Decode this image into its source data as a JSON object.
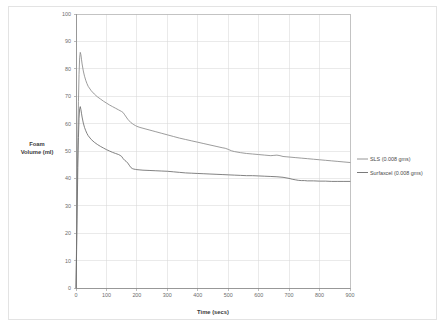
{
  "chart_data": {
    "type": "line",
    "title": "",
    "xlabel": "Time (secs)",
    "ylabel": "Foam Volume (ml)",
    "ylabel_line1": "Foam",
    "ylabel_line2": "Volume (ml)",
    "xlim": [
      0,
      900
    ],
    "ylim": [
      0,
      100
    ],
    "xticks": [
      0,
      100,
      200,
      300,
      400,
      500,
      600,
      700,
      800,
      900
    ],
    "yticks": [
      0,
      10,
      20,
      30,
      40,
      50,
      60,
      70,
      80,
      90,
      100
    ],
    "xtick_labels": [
      "0",
      "100",
      "200",
      "300",
      "400",
      "500",
      "600",
      "700",
      "800",
      "900"
    ],
    "ytick_labels": [
      "0",
      "10",
      "20",
      "30",
      "40",
      "50",
      "60",
      "70",
      "80",
      "90",
      "100"
    ],
    "grid": true,
    "grid_color": "#d6d6d6",
    "legend_position": "right",
    "series": [
      {
        "name": "SLS (0.008 gms)",
        "color": "#8a8a8a",
        "x": [
          0,
          2,
          4,
          6,
          8,
          10,
          12,
          14,
          16,
          18,
          20,
          24,
          28,
          32,
          36,
          40,
          50,
          60,
          70,
          80,
          90,
          100,
          110,
          120,
          130,
          140,
          150,
          155,
          160,
          165,
          170,
          175,
          180,
          185,
          190,
          195,
          200,
          210,
          220,
          230,
          240,
          250,
          260,
          280,
          300,
          320,
          340,
          360,
          380,
          400,
          420,
          440,
          460,
          480,
          490,
          500,
          510,
          520,
          540,
          560,
          580,
          600,
          620,
          640,
          650,
          660,
          670,
          680,
          690,
          700,
          720,
          740,
          760,
          780,
          800,
          820,
          840,
          860,
          880,
          900
        ],
        "y": [
          0,
          18,
          38,
          55,
          68,
          78,
          84,
          86,
          85.2,
          83.5,
          81.8,
          79.2,
          77.3,
          75.8,
          74.6,
          73.6,
          72.0,
          70.8,
          69.8,
          69.0,
          68.2,
          67.5,
          66.8,
          66.2,
          65.6,
          65.0,
          64.4,
          64.0,
          63.2,
          62.4,
          61.6,
          61.0,
          60.4,
          60.0,
          59.6,
          59.3,
          59.0,
          58.6,
          58.3,
          58.0,
          57.7,
          57.4,
          57.1,
          56.5,
          55.9,
          55.3,
          54.7,
          54.2,
          53.7,
          53.2,
          52.7,
          52.2,
          51.7,
          51.2,
          51.0,
          50.6,
          50.1,
          49.8,
          49.4,
          49.1,
          48.9,
          48.7,
          48.5,
          48.3,
          48.4,
          48.5,
          48.3,
          48.0,
          47.9,
          47.8,
          47.6,
          47.4,
          47.2,
          47.0,
          46.8,
          46.6,
          46.4,
          46.2,
          46.0,
          45.8
        ]
      },
      {
        "name": "Surfaxcel (0.008 gms)",
        "color": "#6b6b6b",
        "x": [
          0,
          2,
          4,
          6,
          8,
          10,
          12,
          14,
          16,
          18,
          20,
          24,
          28,
          32,
          36,
          40,
          50,
          60,
          70,
          80,
          90,
          100,
          110,
          120,
          130,
          140,
          145,
          150,
          155,
          160,
          165,
          170,
          175,
          180,
          185,
          190,
          195,
          200,
          210,
          220,
          240,
          260,
          280,
          300,
          320,
          340,
          360,
          380,
          400,
          420,
          440,
          460,
          480,
          500,
          520,
          540,
          560,
          580,
          600,
          620,
          640,
          660,
          680,
          700,
          710,
          720,
          730,
          740,
          750,
          760,
          780,
          800,
          820,
          840,
          860,
          880,
          900
        ],
        "y": [
          0,
          14,
          30,
          44,
          55,
          62,
          65.4,
          66.2,
          65.2,
          63.8,
          62.4,
          60.2,
          58.6,
          57.4,
          56.4,
          55.6,
          54.2,
          53.2,
          52.4,
          51.7,
          51.1,
          50.5,
          50.0,
          49.5,
          49.1,
          48.7,
          48.4,
          48.0,
          47.2,
          46.6,
          46.2,
          45.6,
          44.8,
          44.0,
          43.6,
          43.4,
          43.3,
          43.2,
          43.1,
          43.0,
          42.9,
          42.8,
          42.7,
          42.6,
          42.4,
          42.2,
          42.0,
          41.9,
          41.8,
          41.7,
          41.6,
          41.5,
          41.4,
          41.3,
          41.2,
          41.1,
          41.0,
          41.0,
          40.9,
          40.8,
          40.7,
          40.6,
          40.4,
          40.0,
          39.7,
          39.5,
          39.3,
          39.2,
          39.2,
          39.1,
          39.1,
          39.0,
          39.0,
          38.9,
          38.9,
          38.9,
          38.9
        ]
      }
    ],
    "legend": [
      {
        "label": "SLS (0.008 gms)",
        "color": "#8a8a8a"
      },
      {
        "label": "Surfaxcel (0.008 gms)",
        "color": "#6b6b6b"
      }
    ]
  }
}
